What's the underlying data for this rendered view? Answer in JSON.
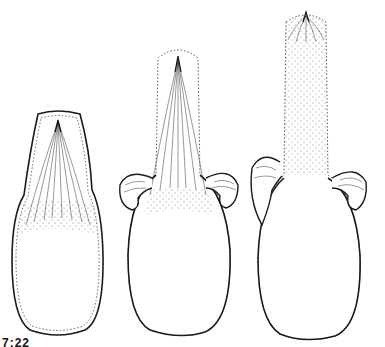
{
  "figure": {
    "label": "7:22",
    "stroke_color": "#1a1a1a",
    "stipple_color": "#555555",
    "forms": [
      {
        "id": "form-1",
        "stage": "early",
        "has_lateral_appendages": false
      },
      {
        "id": "form-2",
        "stage": "middle",
        "has_lateral_appendages": true
      },
      {
        "id": "form-3",
        "stage": "late",
        "has_lateral_appendages": true
      }
    ]
  }
}
